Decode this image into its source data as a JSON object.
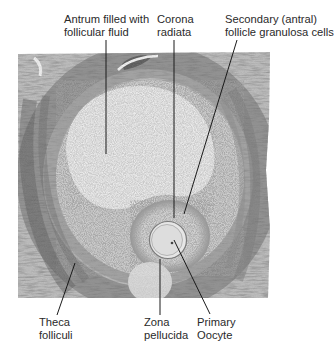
{
  "figure": {
    "image": {
      "x": 18,
      "y": 52,
      "width": 252,
      "height": 246
    },
    "oocyte": {
      "cx": 168,
      "cy": 240,
      "r": 18
    }
  },
  "labels": {
    "antrum": {
      "line1": "Antrum filled with",
      "line2": "follicular fluid",
      "x": 64,
      "y": 15
    },
    "corona": {
      "line1": "Corona",
      "line2": "radiata",
      "x": 157,
      "y": 15
    },
    "secondary": {
      "line1": "Secondary (antral)",
      "line2": "follicle granulosa cells",
      "x": 225,
      "y": 15
    },
    "theca": {
      "line1": "Theca",
      "line2": "folliculi",
      "x": 39,
      "y": 317
    },
    "zona": {
      "line1": "Zona",
      "line2": "pellucida",
      "x": 144,
      "y": 317
    },
    "primary": {
      "line1": "Primary",
      "line2": "Oocyte",
      "x": 197,
      "y": 317
    }
  },
  "leaders": [
    {
      "name": "antrum-leader",
      "x1": 106,
      "y1": 40,
      "x2": 106,
      "y2": 154
    },
    {
      "name": "corona-leader",
      "x1": 174,
      "y1": 40,
      "x2": 174,
      "y2": 218
    },
    {
      "name": "secondary-leader",
      "x1": 237,
      "y1": 40,
      "x2": 184,
      "y2": 214
    },
    {
      "name": "theca-leader",
      "x1": 75,
      "y1": 263,
      "x2": 57,
      "y2": 315
    },
    {
      "name": "zona-leader",
      "x1": 160,
      "y1": 259,
      "x2": 160,
      "y2": 315
    },
    {
      "name": "primary-leader",
      "x1": 174,
      "y1": 240,
      "x2": 210,
      "y2": 314
    }
  ],
  "colors": {
    "line": "#1a1a1a",
    "text": "#2a2a2a",
    "tissue_dark": "#5a5a5a",
    "tissue_light": "#e8e8e8"
  }
}
